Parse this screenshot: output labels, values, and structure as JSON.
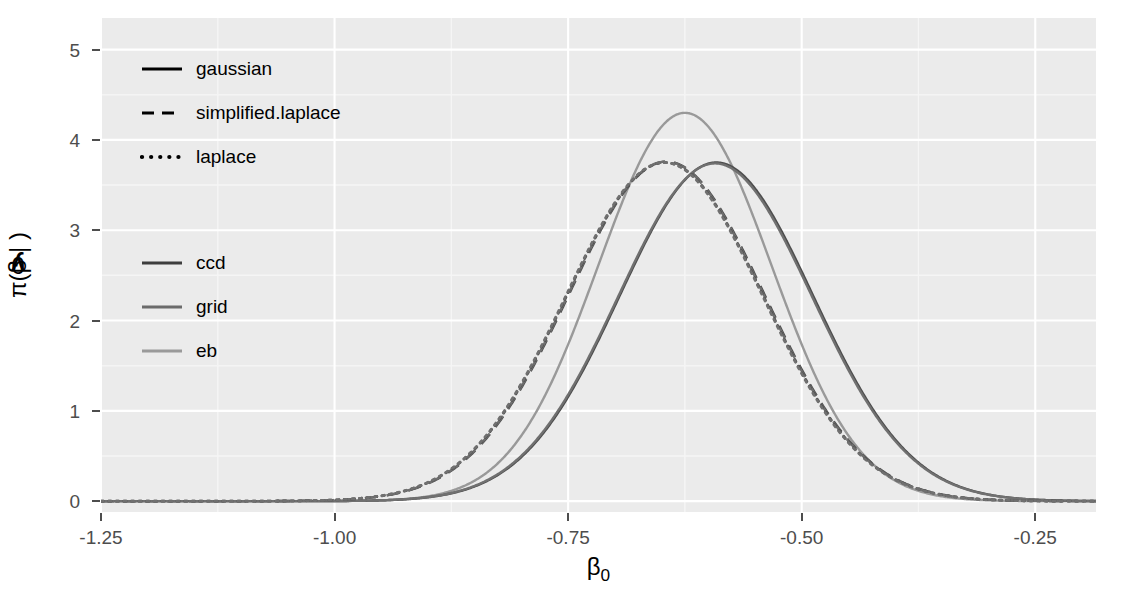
{
  "chart_data": {
    "type": "line",
    "title": "",
    "xlabel": "β₀",
    "ylabel": "π(β₀ | y)",
    "xlim": [
      -1.25,
      -0.185
    ],
    "ylim": [
      -0.12,
      5.35
    ],
    "xticks": [
      -1.25,
      -1.0,
      -0.75,
      -0.5,
      -0.25
    ],
    "xticklabels": [
      "-1.25",
      "-1.00",
      "-0.75",
      "-0.50",
      "-0.25"
    ],
    "yticks": [
      0,
      1,
      2,
      3,
      4,
      5
    ],
    "yticklabels": [
      "0",
      "1",
      "2",
      "3",
      "4",
      "5"
    ],
    "grid": true,
    "grid_major_color": "#ffffff",
    "grid_minor_color": "#f5f5f5",
    "panel_background": "#ebebeb",
    "legend_position": "inside-left",
    "series": [
      {
        "name": "gaussian / eb",
        "linetype": "solid",
        "color": "#999999",
        "mean": -0.625,
        "sd": 0.0928,
        "peak": 4.3,
        "skew": 0.0
      },
      {
        "name": "gaussian / ccd",
        "linetype": "solid",
        "color": "#4d4d4d",
        "mean": -0.6155,
        "sd": 0.1064,
        "peak": 3.75,
        "skew": 0.3
      },
      {
        "name": "gaussian / grid",
        "linetype": "solid",
        "color": "#707070",
        "mean": -0.6165,
        "sd": 0.1064,
        "peak": 3.74,
        "skew": 0.295
      },
      {
        "name": "simplified.laplace / ccd",
        "linetype": "dashed",
        "color": "#4d4d4d",
        "mean": -0.6345,
        "sd": 0.1055,
        "peak": 3.76,
        "skew": -0.12
      },
      {
        "name": "simplified.laplace / grid",
        "linetype": "dashed",
        "color": "#707070",
        "mean": -0.635,
        "sd": 0.1055,
        "peak": 3.76,
        "skew": -0.125
      },
      {
        "name": "laplace / ccd",
        "linetype": "dotted",
        "color": "#4d4d4d",
        "mean": -0.6355,
        "sd": 0.1058,
        "peak": 3.75,
        "skew": -0.13
      },
      {
        "name": "laplace / grid",
        "linetype": "dotted",
        "color": "#707070",
        "mean": -0.636,
        "sd": 0.1058,
        "peak": 3.75,
        "skew": -0.133
      }
    ]
  },
  "legends": {
    "method": {
      "title": "",
      "items": [
        {
          "label": "gaussian",
          "linetype": "solid",
          "color": "#000000"
        },
        {
          "label": "simplified.laplace",
          "linetype": "dashed",
          "color": "#000000"
        },
        {
          "label": "laplace",
          "linetype": "dotted",
          "color": "#000000"
        }
      ]
    },
    "strategy": {
      "title": "",
      "items": [
        {
          "label": "ccd",
          "linetype": "solid",
          "color": "#3d3d3d"
        },
        {
          "label": "grid",
          "linetype": "solid",
          "color": "#6b6b6b"
        },
        {
          "label": "eb",
          "linetype": "solid",
          "color": "#9a9a9a"
        }
      ]
    }
  }
}
